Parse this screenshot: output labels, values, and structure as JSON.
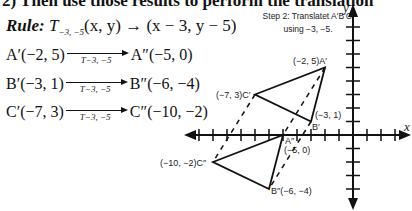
{
  "header": {
    "title": "2)   Then use those results to perform the translation"
  },
  "rule": {
    "label": "Rule:",
    "transform": "T",
    "subscript": "−3, −5",
    "mapping": "(x, y) → (x − 3, y − 5)"
  },
  "mappings": [
    {
      "from": "A′(−2, 5)",
      "arrow_label": "T−3, −5",
      "to": "A″(−5, 0)"
    },
    {
      "from": "B′(−3, 1)",
      "arrow_label": "T−3, −5",
      "to": "B″(−6, −4)"
    },
    {
      "from": "C′(−7, 3)",
      "arrow_label": "T−3, −5",
      "to": "C″(−10, −2)"
    }
  ],
  "step_note": {
    "line1": "Step 2: Translatet A′B′C′",
    "line2": "using −3, −5."
  },
  "graph": {
    "x_axis_label": "x",
    "y_axis_label": "y",
    "points": {
      "A1": {
        "label": "(−2, 5)A′",
        "x": -2,
        "y": 5
      },
      "B1": {
        "label_coord": "(−3, 1)",
        "label_name": "B′",
        "x": -3,
        "y": 1
      },
      "C1": {
        "label": "(−7, 3)C′",
        "x": -7,
        "y": 3
      },
      "A2": {
        "label_name": "A″",
        "label_coord": "(−5, 0)",
        "x": -5,
        "y": 0
      },
      "B2": {
        "label": "B″(−6, −4)",
        "x": -6,
        "y": -4
      },
      "C2": {
        "label": "(−10, −2)C″",
        "x": -10,
        "y": -2
      }
    },
    "colors": {
      "line": "#111111",
      "background": "#ffffff"
    }
  }
}
